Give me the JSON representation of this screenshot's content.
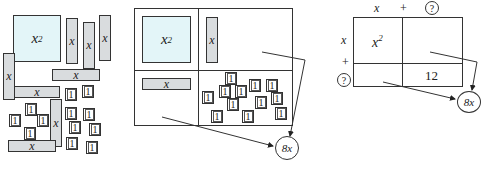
{
  "figure": {
    "panel1": {
      "square_label": "x",
      "square_exp": "2",
      "bar_label": "x",
      "tile_label": "1",
      "bar_count": 8,
      "tile_count": 12
    },
    "panel2": {
      "square_label": "x",
      "square_exp": "2",
      "bar_label": "x",
      "tile_label": "1",
      "tile_count": 12,
      "result_label": "8x"
    },
    "panel3": {
      "top_labels": [
        "x",
        "+",
        "?"
      ],
      "left_labels": [
        "x",
        "+",
        "?"
      ],
      "cell_top_left": "x",
      "cell_top_left_exp": "2",
      "cell_bottom_right": "12",
      "result_label": "8x"
    }
  }
}
